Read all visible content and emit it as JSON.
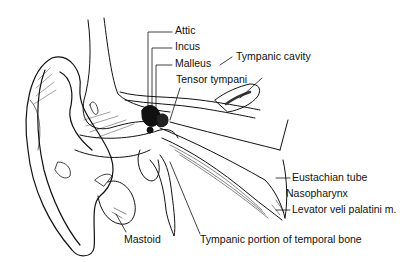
{
  "diagram": {
    "style": "black and white line drawing",
    "labels": {
      "attic": "Attic",
      "incus": "Incus",
      "malleus": "Malleus",
      "tympanic_cavity": "Tympanic cavity",
      "tensor_tympani": "Tensor tympani",
      "eustachian_tube": "Eustachian tube",
      "nasopharynx": "Nasopharynx",
      "levator": "Levator veli palatini m.",
      "mastoid": "Mastoid",
      "tympanic_portion": "Tympanic portion of temporal bone"
    }
  }
}
